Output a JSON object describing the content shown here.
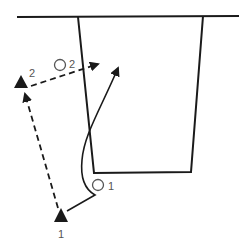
{
  "diagram": {
    "colors": {
      "stroke": "#1a1a1a",
      "label": "#555555",
      "background": "#ffffff"
    },
    "players": [
      {
        "id": "triangle-1",
        "shape": "triangle",
        "label": "1",
        "x": 61,
        "y": 216
      },
      {
        "id": "triangle-2",
        "shape": "triangle",
        "label": "2",
        "x": 21,
        "y": 82
      },
      {
        "id": "circle-1",
        "shape": "circle",
        "label": "1",
        "x": 98,
        "y": 185
      },
      {
        "id": "circle-2",
        "shape": "circle",
        "label": "2",
        "x": 60,
        "y": 65
      }
    ],
    "paths": [
      {
        "id": "triangle-run",
        "style": "dashed",
        "from": "triangle-1",
        "to": "triangle-2"
      },
      {
        "id": "triangle-2-run",
        "style": "dashed",
        "from": "triangle-2",
        "to": "right toward box"
      },
      {
        "id": "pass-curve",
        "style": "solid",
        "from": "triangle-1",
        "to": "inside box top"
      }
    ],
    "labels": {
      "t1": "1",
      "t2": "2",
      "c1": "1",
      "c2": "2"
    }
  }
}
